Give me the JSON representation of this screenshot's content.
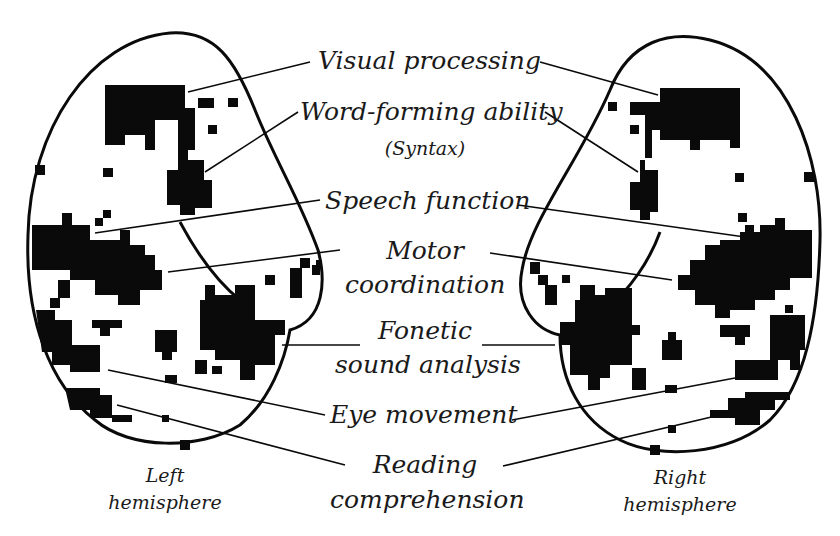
{
  "labels": {
    "visual_processing": "Visual processing",
    "word_forming": "Word-forming ability",
    "syntax": "(Syntax)",
    "speech_function": "Speech function",
    "motor_line1": "Motor",
    "motor_line2": "coordination",
    "fonetic_line1": "Fonetic",
    "fonetic_line2": "sound analysis",
    "eye_movement": "Eye movement",
    "reading_line1": "Reading",
    "reading_line2": "comprehension"
  },
  "hemispheres": {
    "left_line1": "Left",
    "left_line2": "hemisphere",
    "right_line1": "Right",
    "right_line2": "hemisphere"
  },
  "colors": {
    "ink": "#0a0a0a",
    "background": "#ffffff"
  }
}
